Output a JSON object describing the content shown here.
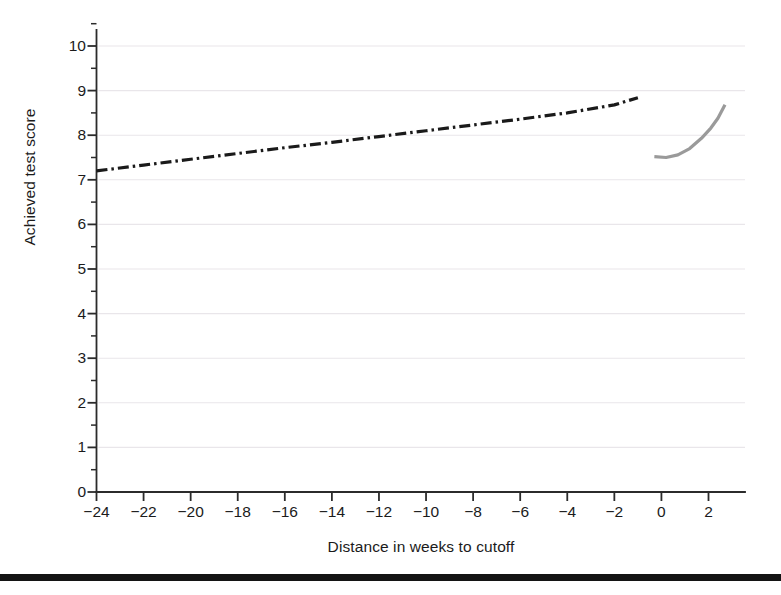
{
  "chart_data": {
    "type": "line",
    "title": "",
    "subtitle": "",
    "xlabel": "Distance in weeks to cutoff",
    "ylabel": "Achieved test score",
    "xlim": [
      -25.2,
      3.7
    ],
    "ylim": [
      0,
      10.3
    ],
    "xticks": [
      -24,
      -22,
      -20,
      -18,
      -16,
      -14,
      -12,
      -10,
      -8,
      -6,
      -4,
      -2,
      0,
      2
    ],
    "xtick_labels": [
      "−24",
      "−22",
      "−20",
      "−18",
      "−16",
      "−14",
      "−12",
      "−10",
      "−8",
      "−6",
      "−4",
      "−2",
      "0",
      "2"
    ],
    "yticks": [
      0,
      1,
      2,
      3,
      4,
      5,
      6,
      7,
      8,
      9,
      10
    ],
    "ytick_labels": [
      "0",
      "1",
      "2",
      "3",
      "4",
      "5",
      "6",
      "7",
      "8",
      "9",
      "10"
    ],
    "y_minor_ticks": [
      0.5,
      1.5,
      2.5,
      3.5,
      4.5,
      5.5,
      6.5,
      7.5,
      8.5,
      9.5
    ],
    "grid": "horizontal-faint",
    "legend": "none",
    "annotations": [],
    "series": [
      {
        "name": "left-of-cutoff fit",
        "style": "dash-dot",
        "color": "#1a1a1a",
        "linewidth": 3.2,
        "points": [
          {
            "x": -24.0,
            "y": 7.2
          },
          {
            "x": -22.0,
            "y": 7.33
          },
          {
            "x": -20.0,
            "y": 7.46
          },
          {
            "x": -18.0,
            "y": 7.59
          },
          {
            "x": -16.0,
            "y": 7.72
          },
          {
            "x": -14.0,
            "y": 7.84
          },
          {
            "x": -12.0,
            "y": 7.97
          },
          {
            "x": -10.0,
            "y": 8.1
          },
          {
            "x": -8.0,
            "y": 8.23
          },
          {
            "x": -6.0,
            "y": 8.36
          },
          {
            "x": -4.0,
            "y": 8.5
          },
          {
            "x": -2.0,
            "y": 8.68
          },
          {
            "x": -1.0,
            "y": 8.84
          }
        ]
      },
      {
        "name": "right-of-cutoff fit",
        "style": "solid",
        "color": "#9a9a9a",
        "linewidth": 3.2,
        "points": [
          {
            "x": -0.3,
            "y": 7.52
          },
          {
            "x": 0.2,
            "y": 7.5
          },
          {
            "x": 0.7,
            "y": 7.56
          },
          {
            "x": 1.2,
            "y": 7.7
          },
          {
            "x": 1.7,
            "y": 7.93
          },
          {
            "x": 2.1,
            "y": 8.16
          },
          {
            "x": 2.4,
            "y": 8.38
          },
          {
            "x": 2.7,
            "y": 8.68
          }
        ]
      }
    ]
  },
  "axes": {
    "y_axis_label": "Achieved test score",
    "x_axis_label": "Distance in weeks to cutoff"
  }
}
